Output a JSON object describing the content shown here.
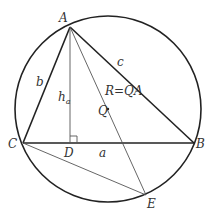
{
  "diagram": {
    "colors": {
      "stroke": "#222222",
      "thin": "#555555",
      "label": "#333333"
    },
    "circle": {
      "cx": 108,
      "cy": 109,
      "r": 93
    },
    "points": {
      "A": {
        "x": 70,
        "y": 27,
        "label": "A"
      },
      "B": {
        "x": 194,
        "y": 143,
        "label": "B"
      },
      "C": {
        "x": 23,
        "y": 143,
        "label": "C"
      },
      "D": {
        "x": 70,
        "y": 143,
        "label": "D"
      },
      "E": {
        "x": 146,
        "y": 195,
        "label": "E"
      },
      "Q": {
        "x": 108,
        "y": 109,
        "label": "Q"
      }
    },
    "segments": {
      "b": "b",
      "c": "c",
      "a": "a",
      "h": "h",
      "h_sub": "a",
      "R": "R=QA"
    }
  }
}
